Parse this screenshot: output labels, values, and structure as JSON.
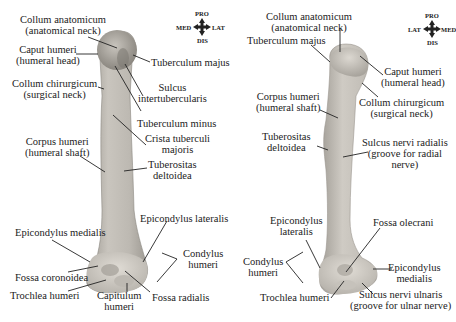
{
  "colors": {
    "background": "#ffffff",
    "bone_light": "#d6d2cb",
    "bone_mid": "#b8b4ad",
    "bone_dark": "#8f8b85",
    "label_text": "#222222",
    "leader_line": "#222222"
  },
  "left_view": {
    "compass": {
      "top": "PRO",
      "left": "MED",
      "right": "LAT",
      "bottom": "DIS"
    },
    "labels": [
      {
        "id": "collum-anatomicum",
        "lines": [
          "Collum anatomicum",
          "(anatomical neck)"
        ]
      },
      {
        "id": "caput-humeri",
        "lines": [
          "Caput humeri",
          "(humeral head)"
        ]
      },
      {
        "id": "tuberculum-majus",
        "lines": [
          "Tuberculum majus"
        ]
      },
      {
        "id": "collum-chirurgicum",
        "lines": [
          "Collum chirurgicum",
          "(surgical neck)"
        ]
      },
      {
        "id": "sulcus-intertubercularis",
        "lines": [
          "Sulcus",
          "intertubercularis"
        ]
      },
      {
        "id": "tuberculum-minus",
        "lines": [
          "Tuberculum minus"
        ]
      },
      {
        "id": "crista-tuberculi-majoris",
        "lines": [
          "Crista tuberculi",
          "majoris"
        ]
      },
      {
        "id": "corpus-humeri",
        "lines": [
          "Corpus humeri",
          "(humeral shaft)"
        ]
      },
      {
        "id": "tuberositas-deltoidea",
        "lines": [
          "Tuberositas",
          "deltoidea"
        ]
      },
      {
        "id": "epicondylus-lateralis",
        "lines": [
          "Epicondylus lateralis"
        ]
      },
      {
        "id": "epicondylus-medialis",
        "lines": [
          "Epicondylus medialis"
        ]
      },
      {
        "id": "condylus-humeri",
        "lines": [
          "Condylus",
          "humeri"
        ]
      },
      {
        "id": "fossa-coronoidea",
        "lines": [
          "Fossa coronoidea"
        ]
      },
      {
        "id": "trochlea-humeri",
        "lines": [
          "Trochlea humeri"
        ]
      },
      {
        "id": "capitulum-humeri",
        "lines": [
          "Capitulum",
          "humeri"
        ]
      },
      {
        "id": "fossa-radialis",
        "lines": [
          "Fossa radialis"
        ]
      }
    ]
  },
  "right_view": {
    "compass": {
      "top": "PRO",
      "left": "LAT",
      "right": "MED",
      "bottom": "DIS"
    },
    "labels": [
      {
        "id": "collum-anatomicum",
        "lines": [
          "Collum anatomicum",
          "(anatomical neck)"
        ]
      },
      {
        "id": "tuberculum-majus",
        "lines": [
          "Tuberculum majus"
        ]
      },
      {
        "id": "caput-humeri",
        "lines": [
          "Caput humeri",
          "(humeral head)"
        ]
      },
      {
        "id": "corpus-humeri",
        "lines": [
          "Corpus humeri",
          "(humeral shaft)"
        ]
      },
      {
        "id": "collum-chirurgicum",
        "lines": [
          "Collum chirurgicum",
          "(surgical neck)"
        ]
      },
      {
        "id": "tuberositas-deltoidea",
        "lines": [
          "Tuberositas",
          "deltoidea"
        ]
      },
      {
        "id": "sulcus-nervi-radialis",
        "lines": [
          "Sulcus nervi radialis",
          "(groove for radial",
          "nerve)"
        ]
      },
      {
        "id": "epicondylus-lateralis",
        "lines": [
          "Epicondylus",
          "lateralis"
        ]
      },
      {
        "id": "fossa-olecrani",
        "lines": [
          "Fossa olecrani"
        ]
      },
      {
        "id": "condylus-humeri",
        "lines": [
          "Condylus",
          "humeri"
        ]
      },
      {
        "id": "epicondylus-medialis",
        "lines": [
          "Epicondylus",
          "medialis"
        ]
      },
      {
        "id": "trochlea-humeri",
        "lines": [
          "Trochlea humeri"
        ]
      },
      {
        "id": "sulcus-nervi-ulnaris",
        "lines": [
          "Sulcus nervi ulnaris",
          "(groove for ulnar nerve)"
        ]
      }
    ]
  }
}
